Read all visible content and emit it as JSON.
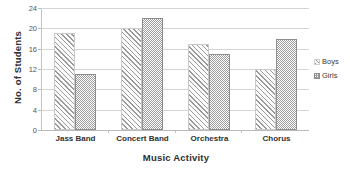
{
  "chart_data": {
    "type": "bar",
    "title": "",
    "xlabel": "Music Activity",
    "ylabel": "No. of Students",
    "categories": [
      "Jass Band",
      "Concert Band",
      "Orchestra",
      "Chorus"
    ],
    "series": [
      {
        "name": "Boys",
        "values": [
          19,
          20,
          17,
          12
        ],
        "pattern": "diagonal-hatch"
      },
      {
        "name": "Girls",
        "values": [
          11,
          22,
          15,
          18
        ],
        "pattern": "dotted-gray"
      }
    ],
    "ylim": [
      0,
      24
    ],
    "ytick_step": 4,
    "yticks": [
      0,
      4,
      8,
      12,
      16,
      20,
      24
    ],
    "grid": true,
    "legend_position": "right",
    "legend": [
      "Boys",
      "Girls"
    ],
    "colors": {
      "boys_hatch": "#9a9a9a",
      "girls_fill": "#9e9e9e",
      "gridline": "#d4d4d4",
      "text": "#2f2f2f",
      "background": "#ffffff"
    }
  }
}
